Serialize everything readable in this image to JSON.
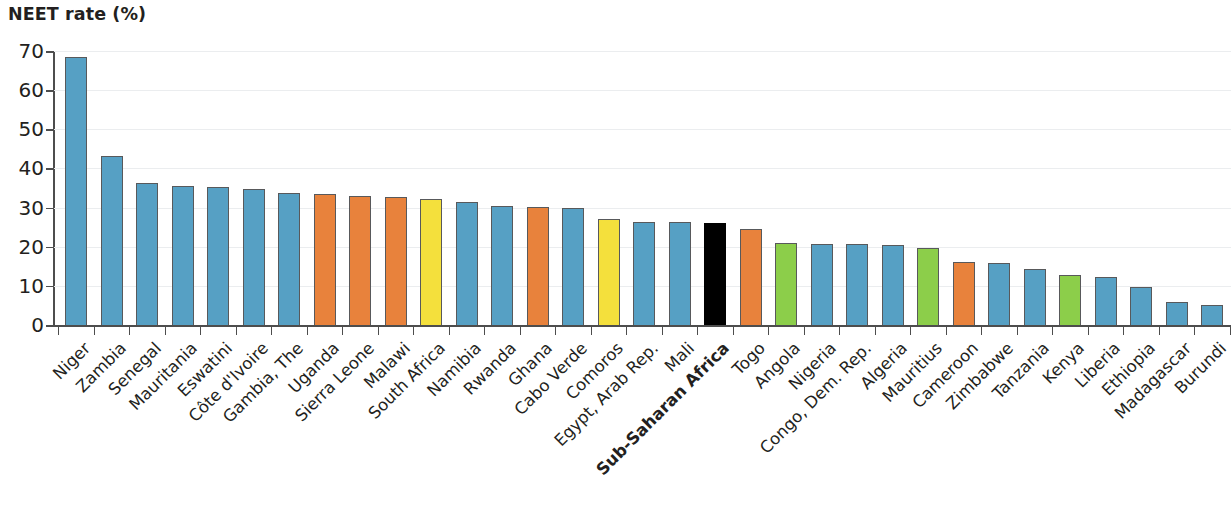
{
  "chart_data": {
    "type": "bar",
    "title": "NEET rate (%)",
    "xlabel": "",
    "ylabel": "NEET rate (%)",
    "ylim": [
      0,
      70
    ],
    "yticks": [
      0,
      10,
      20,
      30,
      40,
      50,
      60,
      70
    ],
    "grid": true,
    "legend": "none",
    "highlight_category": "Sub-Saharan Africa",
    "categories": [
      "Niger",
      "Zambia",
      "Senegal",
      "Mauritania",
      "Eswatini",
      "Côte d'Ivoire",
      "Gambia, The",
      "Uganda",
      "Sierra Leone",
      "Malawi",
      "South Africa",
      "Namibia",
      "Rwanda",
      "Ghana",
      "Cabo Verde",
      "Comoros",
      "Egypt, Arab Rep.",
      "Mali",
      "Sub-Saharan Africa",
      "Togo",
      "Angola",
      "Nigeria",
      "Congo, Dem. Rep.",
      "Algeria",
      "Mauritius",
      "Cameroon",
      "Zimbabwe",
      "Tanzania",
      "Kenya",
      "Liberia",
      "Ethiopia",
      "Madagascar",
      "Burundi"
    ],
    "values": [
      68.5,
      43.3,
      36.2,
      35.6,
      35.3,
      34.7,
      33.8,
      33.4,
      33.0,
      32.7,
      32.1,
      31.4,
      30.4,
      30.1,
      30.0,
      27.2,
      26.4,
      26.2,
      26.0,
      24.5,
      21.0,
      20.8,
      20.8,
      20.4,
      19.8,
      16.2,
      15.8,
      14.2,
      12.9,
      12.2,
      9.7,
      5.8,
      5.2
    ],
    "colors": [
      "#56a0c4",
      "#56a0c4",
      "#56a0c4",
      "#56a0c4",
      "#56a0c4",
      "#56a0c4",
      "#56a0c4",
      "#e8823c",
      "#e8823c",
      "#e8823c",
      "#f4e03c",
      "#56a0c4",
      "#56a0c4",
      "#e8823c",
      "#56a0c4",
      "#f4e03c",
      "#56a0c4",
      "#56a0c4",
      "#000000",
      "#e8823c",
      "#8cce4a",
      "#56a0c4",
      "#56a0c4",
      "#56a0c4",
      "#8cce4a",
      "#e8823c",
      "#56a0c4",
      "#56a0c4",
      "#8cce4a",
      "#56a0c4",
      "#56a0c4",
      "#56a0c4",
      "#56a0c4"
    ],
    "palette": {
      "blue": "#56a0c4",
      "orange": "#e8823c",
      "yellow": "#f4e03c",
      "green": "#8cce4a",
      "black": "#000000",
      "gridline": "#ebedef",
      "axis": "#4d4d4d",
      "bar_outline": "#58595b",
      "text": "#231f20",
      "background": "#ffffff"
    }
  }
}
